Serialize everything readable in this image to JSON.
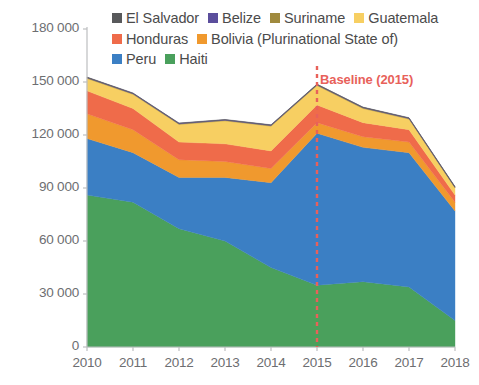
{
  "chart_data": {
    "type": "area",
    "stacked": true,
    "title": "",
    "xlabel": "",
    "ylabel": "",
    "x": [
      2010,
      2011,
      2012,
      2013,
      2014,
      2015,
      2016,
      2017,
      2018
    ],
    "categories": [
      "2010",
      "2011",
      "2012",
      "2013",
      "2014",
      "2015",
      "2016",
      "2017",
      "2018"
    ],
    "ylim": [
      0,
      180000
    ],
    "yticks": [
      0,
      30000,
      60000,
      90000,
      120000,
      150000,
      180000
    ],
    "ytick_labels": [
      "0",
      "30 000",
      "60 000",
      "90 000",
      "120 000",
      "150 000",
      "180 000"
    ],
    "grid": false,
    "legend_position": "top",
    "stack_order_bottom_to_top": [
      "Haiti",
      "Peru",
      "Bolivia (Plurinational State of)",
      "Honduras",
      "Guatemala",
      "Suriname",
      "Belize",
      "El Salvador"
    ],
    "series": [
      {
        "name": "Haiti",
        "color": "#4aa05c",
        "values": [
          86000,
          82000,
          67000,
          60000,
          45000,
          35000,
          37000,
          34000,
          15000
        ]
      },
      {
        "name": "Peru",
        "color": "#3b7fc4",
        "values": [
          32000,
          28000,
          29000,
          36000,
          48000,
          86000,
          76000,
          76000,
          62000
        ]
      },
      {
        "name": "Bolivia (Plurinational State of)",
        "color": "#f0992e",
        "values": [
          14000,
          13000,
          10000,
          9000,
          8000,
          6000,
          6000,
          6000,
          5000
        ]
      },
      {
        "name": "Honduras",
        "color": "#ef6b4a",
        "values": [
          13000,
          12000,
          10000,
          10000,
          10000,
          10000,
          8000,
          7000,
          4000
        ]
      },
      {
        "name": "Guatemala",
        "color": "#f7cf62",
        "values": [
          7000,
          8000,
          10000,
          13000,
          14000,
          11000,
          8000,
          6000,
          4000
        ]
      },
      {
        "name": "Suriname",
        "color": "#a08a3e",
        "values": [
          400,
          400,
          400,
          400,
          400,
          400,
          400,
          400,
          400
        ]
      },
      {
        "name": "Belize",
        "color": "#5b4e9c",
        "values": [
          200,
          200,
          200,
          200,
          200,
          200,
          200,
          200,
          200
        ]
      },
      {
        "name": "El Salvador",
        "color": "#58595b",
        "values": [
          200,
          200,
          200,
          200,
          200,
          200,
          200,
          200,
          200
        ]
      }
    ],
    "totals": [
      152800,
      143800,
      126800,
      128600,
      125600,
      148800,
      135600,
      129600,
      90600
    ],
    "annotations": [
      {
        "name": "baseline",
        "label": "Baseline (2015)",
        "x": 2015,
        "color": "#e8615a",
        "style": "dashed-vertical"
      }
    ]
  },
  "legend": {
    "rows": [
      [
        {
          "label": "El Salvador",
          "color": "#58595b"
        },
        {
          "label": "Belize",
          "color": "#5b4e9c"
        },
        {
          "label": "Suriname",
          "color": "#a08a3e"
        },
        {
          "label": "Guatemala",
          "color": "#f7cf62"
        }
      ],
      [
        {
          "label": "Honduras",
          "color": "#ef6b4a"
        },
        {
          "label": "Bolivia (Plurinational State of)",
          "color": "#f0992e"
        }
      ],
      [
        {
          "label": "Peru",
          "color": "#3b7fc4"
        },
        {
          "label": "Haiti",
          "color": "#4aa05c"
        }
      ]
    ]
  },
  "axis": {
    "y_labels": [
      "180 000",
      "150 000",
      "120 000",
      "90 000",
      "60 000",
      "30 000",
      "0"
    ],
    "x_labels": [
      "2010",
      "2011",
      "2012",
      "2013",
      "2014",
      "2015",
      "2016",
      "2017",
      "2018"
    ]
  },
  "baseline": {
    "label": "Baseline (2015)",
    "color": "#e8615a"
  },
  "colors": {
    "axis_text": "#6d6e71",
    "axis_line": "#bcbec0",
    "background": "#ffffff"
  }
}
